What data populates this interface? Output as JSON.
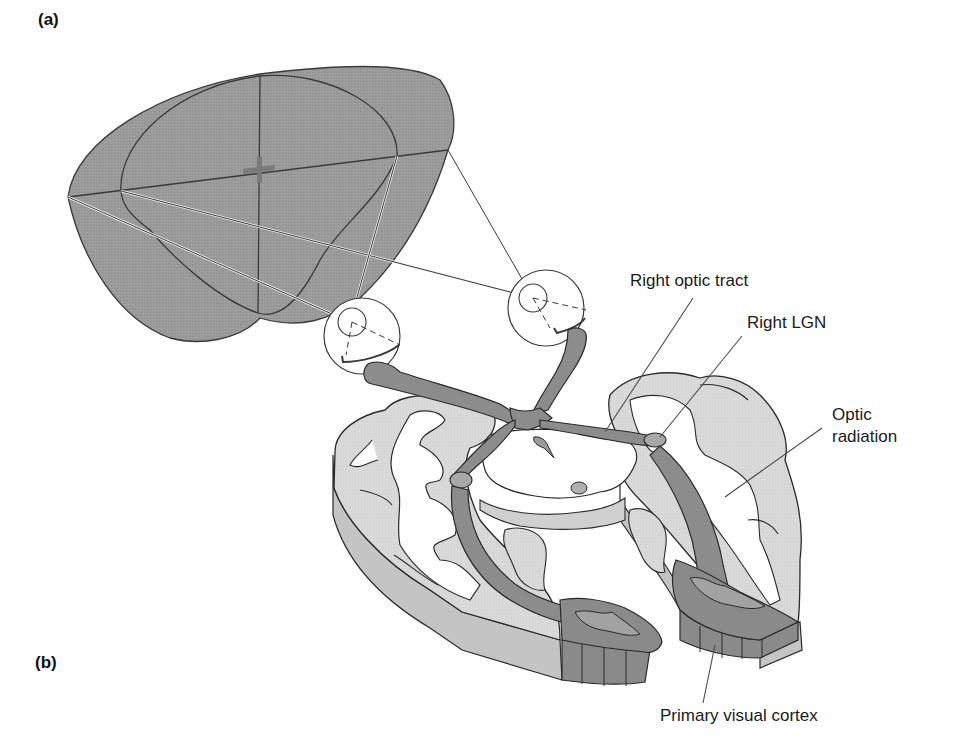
{
  "figure": {
    "panels": [
      {
        "id": "a",
        "label": "(a)"
      },
      {
        "id": "b",
        "label": "(b)"
      }
    ],
    "labels": {
      "right_optic_tract": "Right optic tract",
      "right_lgn": "Right LGN",
      "optic_radiation_line1": "Optic",
      "optic_radiation_line2": "radiation",
      "primary_visual_cortex": "Primary visual cortex"
    },
    "colors": {
      "visual_field_fill": "#9a9a9a",
      "pathway_fill": "#8c8c8c",
      "gray_matter_fill": "#d9d9d9",
      "slab_side_fill": "#c4c4c4",
      "cortex_dark_fill": "#8a8a8a",
      "outline": "#2a2a2a",
      "background": "#ffffff"
    },
    "icons": {
      "fixation_point": "fixation-cross-icon",
      "left_eye": "eye-icon",
      "right_eye": "eye-icon"
    }
  }
}
